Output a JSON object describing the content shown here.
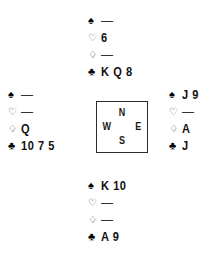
{
  "diagram": {
    "type": "bridge-hand-deal",
    "suit_symbols": {
      "spade": "♠",
      "heart": "♡",
      "diamond": "♢",
      "club": "♣"
    },
    "void_marker": "—",
    "compass": {
      "north": "N",
      "west": "W",
      "east": "E",
      "south": "S"
    },
    "hands": {
      "north": {
        "spades": "—",
        "hearts": "6",
        "diamonds": "—",
        "clubs": "K Q 8"
      },
      "west": {
        "spades": "—",
        "hearts": "—",
        "diamonds": "Q",
        "clubs": "10 7 5"
      },
      "east": {
        "spades": "J 9",
        "hearts": "—",
        "diamonds": "A",
        "clubs": "J"
      },
      "south": {
        "spades": "K 10",
        "hearts": "—",
        "diamonds": "—",
        "clubs": "A 9"
      }
    }
  },
  "colors": {
    "ink": "#111111",
    "box_border": "#2b2b2b",
    "background": "#ffffff"
  }
}
